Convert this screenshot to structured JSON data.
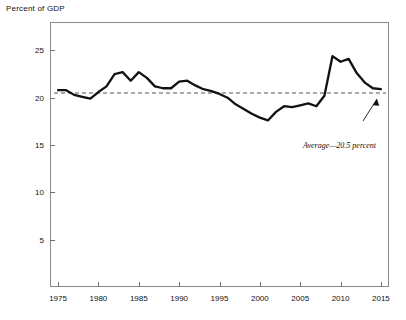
{
  "figure": {
    "axis_title": "Percent of GDP"
  },
  "annotation": {
    "text": "Average—20.5 percent"
  },
  "yticks": [
    {
      "label": "25",
      "value": 25
    },
    {
      "label": "20",
      "value": 20
    },
    {
      "label": "15",
      "value": 15
    },
    {
      "label": "10",
      "value": 10
    },
    {
      "label": "5",
      "value": 5
    }
  ],
  "xticks": [
    {
      "label": "1975",
      "value": 1975
    },
    {
      "label": "1980",
      "value": 1980
    },
    {
      "label": "1985",
      "value": 1985
    },
    {
      "label": "1990",
      "value": 1990
    },
    {
      "label": "1995",
      "value": 1995
    },
    {
      "label": "2000",
      "value": 2000
    },
    {
      "label": "2005",
      "value": 2005
    },
    {
      "label": "2010",
      "value": 2010
    },
    {
      "label": "2015",
      "value": 2015
    }
  ],
  "colors": {
    "line": "#111111",
    "average_line": "#555555",
    "frame": "#8a8a8a",
    "text": "#111111",
    "background": "#ffffff"
  },
  "chart_data": {
    "type": "line",
    "title": "",
    "xlabel": "",
    "ylabel": "Percent of GDP",
    "xlim": [
      1974,
      2016
    ],
    "ylim": [
      0,
      28
    ],
    "grid": false,
    "legend": "none",
    "x": [
      1975,
      1976,
      1977,
      1978,
      1979,
      1980,
      1981,
      1982,
      1983,
      1984,
      1985,
      1986,
      1987,
      1988,
      1989,
      1990,
      1991,
      1992,
      1993,
      1994,
      1995,
      1996,
      1997,
      1998,
      1999,
      2000,
      2001,
      2002,
      2003,
      2004,
      2005,
      2006,
      2007,
      2008,
      2009,
      2010,
      2011,
      2012,
      2013,
      2014,
      2015
    ],
    "series": [
      {
        "name": "Spending as percent of GDP",
        "values": [
          20.8,
          20.8,
          20.3,
          20.1,
          19.9,
          20.6,
          21.2,
          22.5,
          22.7,
          21.8,
          22.7,
          22.1,
          21.2,
          21.0,
          21.0,
          21.7,
          21.8,
          21.3,
          20.9,
          20.7,
          20.4,
          20.0,
          19.3,
          18.8,
          18.3,
          17.9,
          17.6,
          18.5,
          19.1,
          19.0,
          19.2,
          19.4,
          19.1,
          20.2,
          24.4,
          23.8,
          24.1,
          22.6,
          21.6,
          21.0,
          20.9
        ]
      }
    ],
    "reference_line": {
      "label": "Average—20.5 percent",
      "value": 20.5,
      "style": "dashed",
      "orientation": "horizontal"
    }
  }
}
